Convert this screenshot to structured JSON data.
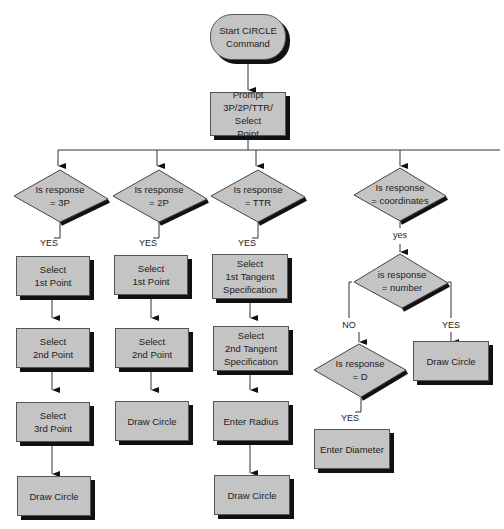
{
  "diagram": {
    "start": "Start CIRCLE\nCommand",
    "prompt": "Prompt\n3P/2P/TTR/ Select\nPoint",
    "decisions": {
      "d3p": "Is response\n= 3P",
      "d2p": "Is response\n= 2P",
      "dttr": "Is response\n= TTR",
      "dcoord": "Is response\n= coordinates",
      "dnum": "is response\n= number",
      "dd": "Is response\n= D"
    },
    "col3p": [
      "Select\n1st Point",
      "Select\n2nd Point",
      "Select\n3rd Point",
      "Draw Circle"
    ],
    "col2p": [
      "Select\n1st Point",
      "Select\n2nd Point",
      "Draw Circle"
    ],
    "colttr": [
      "Select\n1st Tangent\nSpecification",
      "Select\n2nd Tangent\nSpecification",
      "Enter Radius",
      "Draw Circle"
    ],
    "num_yes": "Draw Circle",
    "d_yes": "Enter Diameter",
    "labels": {
      "yes_upper": "YES",
      "yes_lower": "yes",
      "no_upper": "NO"
    }
  }
}
